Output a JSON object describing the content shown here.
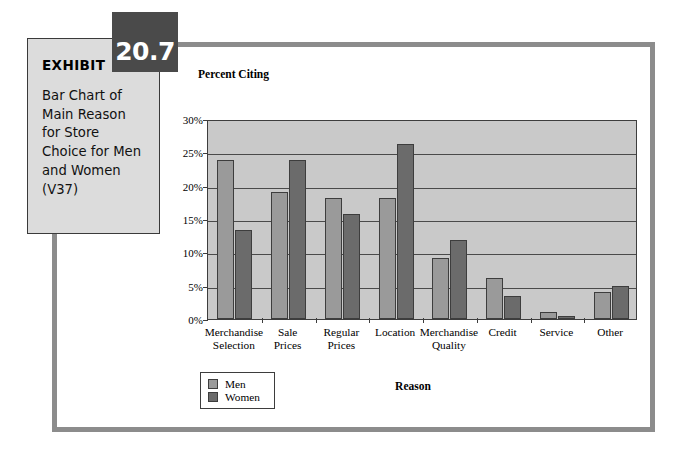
{
  "exhibit": {
    "label": "EXHIBIT",
    "number": "20.7",
    "description": "Bar Chart of Main Reason for Store Choice for Men and Women (V37)"
  },
  "colors": {
    "men_bar": "#9a9a9a",
    "women_bar": "#6b6b6b",
    "plot_background": "#c9c9c9",
    "frame": "#8c8c8c",
    "badge": "#4a4a4a",
    "exhibit_box": "#dcdcdc"
  },
  "legend": {
    "men_label": "Men",
    "women_label": "Women"
  },
  "chart_data": {
    "type": "bar",
    "title": "",
    "ylabel": "Percent Citing",
    "xlabel": "Reason",
    "ylim": [
      0,
      30
    ],
    "ytick_labels": [
      "0%",
      "5%",
      "10%",
      "15%",
      "20%",
      "25%",
      "30%"
    ],
    "ytick_values": [
      0,
      5,
      10,
      15,
      20,
      25,
      30
    ],
    "grid": true,
    "legend_position": "bottom-left",
    "categories": [
      "Merchandise\nSelection",
      "Sale\nPrices",
      "Regular\nPrices",
      "Location",
      "Merchandise\nQuality",
      "Credit",
      "Service",
      "Other"
    ],
    "series": [
      {
        "name": "Men",
        "values": [
          23.8,
          19.0,
          18.2,
          18.2,
          9.2,
          6.1,
          1.0,
          4.1
        ]
      },
      {
        "name": "Women",
        "values": [
          13.3,
          23.8,
          15.8,
          26.2,
          11.8,
          3.5,
          0.4,
          5.0
        ]
      }
    ]
  }
}
